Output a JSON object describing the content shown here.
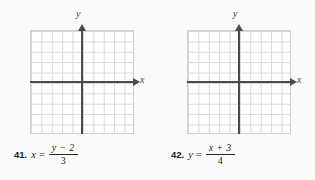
{
  "document": {
    "kind": "math-exercise-worksheet",
    "background_color": "#fbfaf8",
    "ink_color": "#211f20"
  },
  "axis_labels": {
    "x": "x",
    "y": "y"
  },
  "grid": {
    "columns": 10,
    "rows": 10,
    "line_color": "#d7d7db",
    "axis_color": "#4a4a4f"
  },
  "problems": [
    {
      "number": "41.",
      "left_side": "x",
      "equals": "=",
      "fraction": {
        "numerator_variable": "y",
        "numerator_operator": "−",
        "numerator_constant": "2",
        "numerator": "y − 2",
        "denominator": "3"
      }
    },
    {
      "number": "42.",
      "left_side": "y",
      "equals": "=",
      "fraction": {
        "numerator_variable": "x",
        "numerator_operator": "+",
        "numerator_constant": "3",
        "numerator": "x + 3",
        "denominator": "4"
      }
    }
  ]
}
